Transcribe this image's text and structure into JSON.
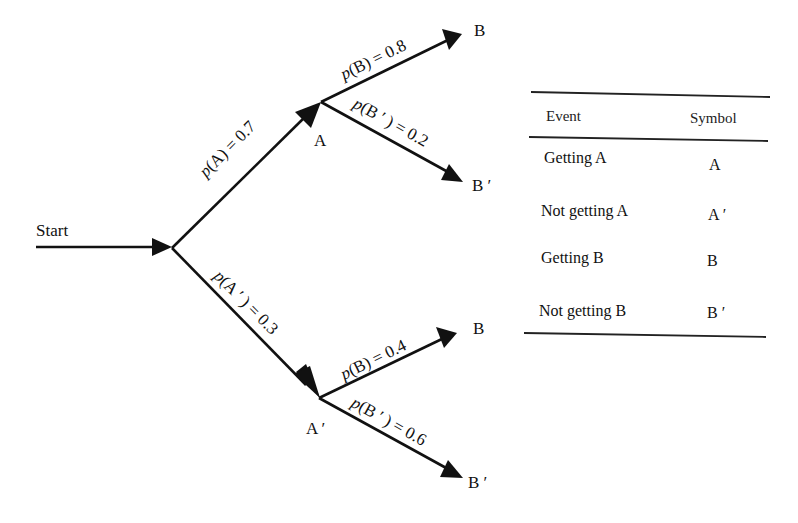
{
  "diagram": {
    "type": "probability-tree",
    "start_label": "Start",
    "nodes": {
      "A": "A",
      "A_prime": "A ′",
      "B_from_A": "B",
      "B_prime_from_A": "B ′",
      "B_from_A_prime": "B",
      "B_prime_from_A_prime": "B ′"
    },
    "edges": [
      {
        "id": "start-A",
        "fn": "p",
        "arg": "(A)",
        "value": " = 0.7"
      },
      {
        "id": "start-A_prime",
        "fn": "p",
        "arg": "(A ′ )",
        "value": " = 0.3"
      },
      {
        "id": "A-B",
        "fn": "p",
        "arg": "(B)",
        "value": " = 0.8"
      },
      {
        "id": "A-B_prime",
        "fn": "p",
        "arg": "(B ′ )",
        "value": " = 0.2"
      },
      {
        "id": "A_prime-B",
        "fn": "p",
        "arg": "(B)",
        "value": " = 0.4"
      },
      {
        "id": "A_prime-B_prime",
        "fn": "p",
        "arg": "(B ′ )",
        "value": " = 0.6"
      }
    ]
  },
  "legend_table": {
    "headers": [
      "Event",
      "Symbol"
    ],
    "rows": [
      {
        "event": "Getting A",
        "symbol": "A"
      },
      {
        "event": "Not getting A",
        "symbol": "A ′"
      },
      {
        "event": "Getting B",
        "symbol": "B"
      },
      {
        "event": "Not getting B",
        "symbol": "B ′"
      }
    ]
  }
}
